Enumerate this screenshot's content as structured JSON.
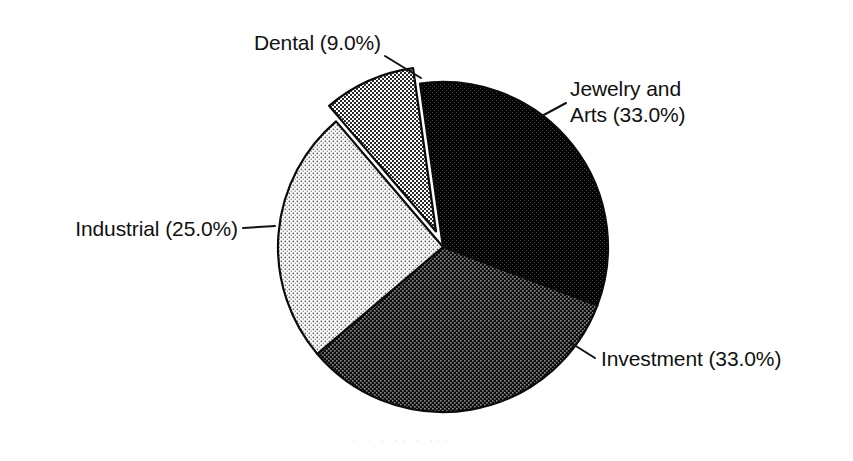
{
  "chart_data": {
    "type": "pie",
    "title": "",
    "subtitle": "",
    "xlabel": "",
    "ylabel": "",
    "legend_position": "none",
    "grid": false,
    "labels_inline": true,
    "categories": [
      "Jewelry and Arts",
      "Investment",
      "Industrial",
      "Dental"
    ],
    "values": [
      33.0,
      33.0,
      25.0,
      9.0
    ],
    "unit": "%",
    "slices": [
      {
        "name": "Jewelry and Arts",
        "value": 33.0,
        "label": "Jewelry and Arts (33.0%)",
        "label_line1": "Jewelry and",
        "label_line2": "Arts (33.0%)",
        "fill": "#0d0d0d",
        "pattern": "halftone-90",
        "exploded": false,
        "start_angle_deg": -8.0,
        "end_angle_deg": 110.8
      },
      {
        "name": "Investment",
        "value": 33.0,
        "label": "Investment (33.0%)",
        "fill": "#303030",
        "pattern": "halftone-78",
        "exploded": false,
        "start_angle_deg": 110.8,
        "end_angle_deg": 229.6
      },
      {
        "name": "Industrial",
        "value": 25.0,
        "label": "Industrial (25.0%)",
        "fill": "#d9d9d9",
        "pattern": "halftone-22",
        "exploded": false,
        "start_angle_deg": 229.6,
        "end_angle_deg": 319.6
      },
      {
        "name": "Dental",
        "value": 9.0,
        "label": "Dental (9.0%)",
        "fill": "#9a9a9a",
        "pattern": "halftone-50",
        "exploded": true,
        "start_angle_deg": 319.6,
        "end_angle_deg": 352.0
      }
    ],
    "geometry": {
      "center_x": 443,
      "center_y": 247,
      "radius": 165,
      "explode_offset": 17
    },
    "colors": {
      "background": "#ffffff",
      "outline": "#0a0a0a",
      "text": "#111111",
      "leader": "#121212"
    }
  },
  "labels": {
    "dental": "Dental (9.0%)",
    "jewelry_line1": "Jewelry and",
    "jewelry_line2": "Arts (33.0%)",
    "industrial": "Industrial (25.0%)",
    "investment": "Investment (33.0%)"
  },
  "artifact": {
    "ghost_text": "·  ·  ·  ··  ·  ···"
  }
}
